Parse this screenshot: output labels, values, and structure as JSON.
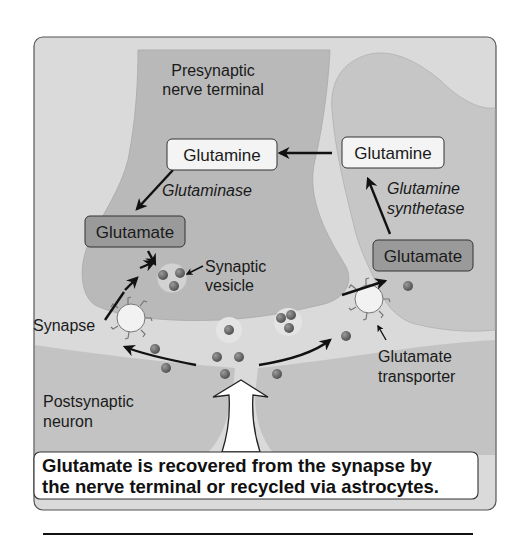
{
  "title_labels": {
    "presynaptic_line1": "Presynaptic",
    "presynaptic_line2": "nerve terminal",
    "postsynaptic_line1": "Postsynaptic",
    "postsynaptic_line2": "neuron"
  },
  "boxes": {
    "glutamine_neuron": "Glutamine",
    "glutamate_neuron": "Glutamate",
    "glutamine_astro": "Glutamine",
    "glutamate_astro": "Glutamate"
  },
  "enzymes": {
    "glutaminase": "Glutaminase",
    "glutamine_synthetase_line1": "Glutamine",
    "glutamine_synthetase_line2": "synthetase"
  },
  "labels": {
    "synaptic_vesicle_line1": "Synaptic",
    "synaptic_vesicle_line2": "vesicle",
    "synapse": "Synapse",
    "glutamate_transporter_line1": "Glutamate",
    "glutamate_transporter_line2": "transporter"
  },
  "caption": {
    "line1": "Glutamate is recovered from the synapse by",
    "line2": "the nerve terminal or recycled via astrocytes."
  },
  "colors": {
    "frame_bg": "#dadada",
    "neuron_fill": "#b9b9b9",
    "astrocyte_fill": "#c6c6c6",
    "cleft": "#e6e6e6",
    "glutamate_box": "#9a9a9a",
    "glutamine_box": "#f4f4f4",
    "molecule": "#6e6e6e"
  }
}
